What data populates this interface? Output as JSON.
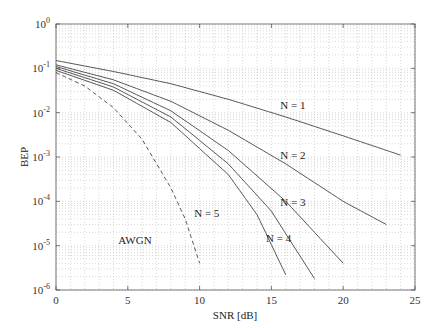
{
  "chart_data": {
    "type": "line",
    "title": "",
    "xlabel": "SNR [dB]",
    "ylabel": "BEP",
    "xscale": "linear",
    "yscale": "log",
    "xlim": [
      0,
      25
    ],
    "ylim": [
      1e-06,
      1
    ],
    "x_ticks": [
      "0",
      "5",
      "10",
      "15",
      "20",
      "25"
    ],
    "y_ticks": [
      "10^0",
      "10^-1",
      "10^-2",
      "10^-3",
      "10^-4",
      "10^-5",
      "10^-6"
    ],
    "grid": true,
    "legend": "inline labels",
    "series": [
      {
        "name": "N = 1",
        "style": "solid",
        "x": [
          0,
          4,
          8,
          12,
          16,
          20,
          24
        ],
        "y": [
          0.15,
          0.085,
          0.045,
          0.02,
          0.008,
          0.003,
          0.0011
        ]
      },
      {
        "name": "N = 2",
        "style": "solid",
        "x": [
          0,
          4,
          8,
          12,
          16,
          20,
          23
        ],
        "y": [
          0.12,
          0.055,
          0.018,
          0.004,
          0.0007,
          0.0001,
          3e-05
        ]
      },
      {
        "name": "N = 3",
        "style": "solid",
        "x": [
          0,
          4,
          8,
          12,
          16,
          20
        ],
        "y": [
          0.11,
          0.045,
          0.011,
          0.0014,
          0.0001,
          4e-06
        ]
      },
      {
        "name": "N = 4",
        "style": "solid",
        "x": [
          0,
          4,
          8,
          12,
          15,
          18
        ],
        "y": [
          0.1,
          0.038,
          0.008,
          0.0007,
          6e-05,
          1.8e-06
        ]
      },
      {
        "name": "N = 5",
        "style": "solid",
        "x": [
          0,
          4,
          8,
          12,
          14,
          16
        ],
        "y": [
          0.09,
          0.032,
          0.006,
          0.0004,
          5e-05,
          2.2e-06
        ]
      },
      {
        "name": "AWGN",
        "style": "dashed",
        "x": [
          0,
          2,
          4,
          6,
          8,
          9,
          10
        ],
        "y": [
          0.08,
          0.04,
          0.013,
          0.0025,
          0.0002,
          4e-05,
          4e-06
        ]
      }
    ],
    "annotations": [
      {
        "text": "N = 1",
        "x": 16.5,
        "y": 0.012
      },
      {
        "text": "N = 2",
        "x": 16.5,
        "y": 0.0009
      },
      {
        "text": "N = 3",
        "x": 16.5,
        "y": 8e-05
      },
      {
        "text": "N = 4",
        "x": 15.5,
        "y": 1.2e-05
      },
      {
        "text": "N = 5",
        "x": 10.5,
        "y": 4.5e-05
      },
      {
        "text": "AWGN",
        "x": 5.5,
        "y": 1.1e-05
      }
    ]
  }
}
